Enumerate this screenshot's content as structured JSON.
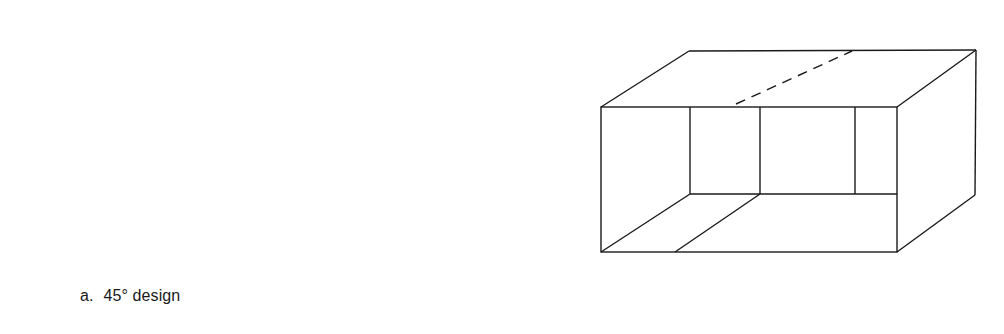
{
  "figure": {
    "panels": [
      {
        "id": "a",
        "letter": "a.",
        "label": "45° design"
      },
      {
        "id": "b",
        "letter": "b.",
        "label": "4-quadrant design"
      },
      {
        "id": "c",
        "letter": "c.",
        "label": "Shoe box design"
      }
    ],
    "stroke_color": "#1a1a1a",
    "background": "#ffffff"
  }
}
